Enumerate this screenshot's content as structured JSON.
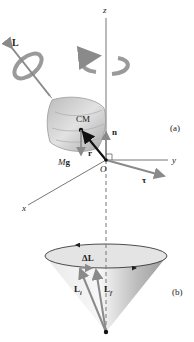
{
  "figure_a": {
    "part_label": "(a)",
    "axis_z": "z",
    "axis_y": "y",
    "axis_x": "x",
    "origin": "O",
    "angular_momentum": "L",
    "center_of_mass": "CM",
    "normal_force": "n",
    "position_vector": "r",
    "weight_M": "M",
    "weight_g": "g",
    "torque": "τ"
  },
  "figure_b": {
    "part_label": "(b)",
    "delta_L": "ΔL",
    "L_initial": "L",
    "L_initial_sub": "i",
    "L_final": "L",
    "L_final_sub": "f"
  },
  "colors": {
    "axis": "#555555",
    "vector_gray": "#8a8a8a",
    "vector_black": "#111111",
    "top_fill": "#c8c8c8",
    "cone_fill": "#d8d8d8"
  }
}
